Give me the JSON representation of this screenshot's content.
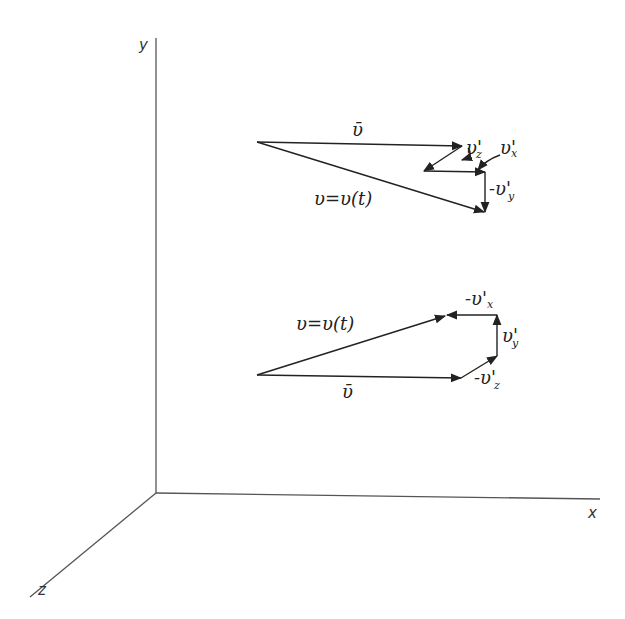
{
  "diagram": {
    "type": "vector-decomposition",
    "axes": {
      "x_label": "x",
      "y_label": "y",
      "z_label": "z"
    },
    "upper_figure": {
      "mean_velocity_label": "ῡ",
      "instant_velocity_label": "υ=υ(t)",
      "components": [
        {
          "label": "υ'",
          "sub": "z"
        },
        {
          "label": "υ'",
          "sub": "x"
        },
        {
          "label": "-υ'",
          "sub": "y"
        }
      ]
    },
    "lower_figure": {
      "mean_velocity_label": "ῡ",
      "instant_velocity_label": "υ=υ(t)",
      "components": [
        {
          "label": "-υ'",
          "sub": "z"
        },
        {
          "label": "υ'",
          "sub": "y"
        },
        {
          "label": "-υ'",
          "sub": "x"
        }
      ]
    }
  }
}
